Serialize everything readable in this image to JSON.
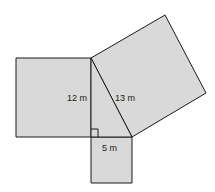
{
  "diagram": {
    "fill_color": "#d9d9d9",
    "stroke_color": "#1a1a1a",
    "labels": {
      "leg_vertical": "12 m",
      "hypotenuse": "13 m",
      "leg_horizontal": "5 m"
    },
    "shapes": [
      {
        "name": "square-on-12m-leg",
        "side": "12 m"
      },
      {
        "name": "square-on-13m-hypotenuse",
        "side": "13 m"
      },
      {
        "name": "square-on-5m-leg",
        "side": "5 m"
      },
      {
        "name": "right-triangle",
        "sides": [
          "5 m",
          "12 m",
          "13 m"
        ]
      }
    ]
  }
}
